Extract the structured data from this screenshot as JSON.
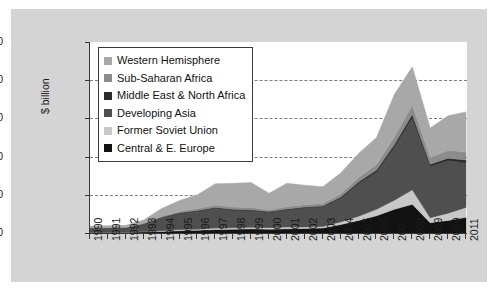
{
  "figure": {
    "background": "#d4d4d4",
    "plot_background": "#ffffff",
    "axis_color": "#3a3a3a",
    "grid_color": "#7d7d7d"
  },
  "chart_data": {
    "type": "area",
    "stacked": true,
    "title": "",
    "xlabel": "",
    "ylabel": "$ billion",
    "ylim": [
      0,
      500
    ],
    "yticks": [
      0,
      100,
      200,
      300,
      400,
      500
    ],
    "grid": true,
    "grid_style": "dashed",
    "legend_position": "upper-left",
    "categories": [
      "1990",
      "1991",
      "1992",
      "1993",
      "1994",
      "1995",
      "1996",
      "1997",
      "1998",
      "1999",
      "2000",
      "2001",
      "2002",
      "2003",
      "2004",
      "2005",
      "2006",
      "2007",
      "2008",
      "2009",
      "2010",
      "2011"
    ],
    "series": [
      {
        "name": "Central & E. Europe",
        "color": "#121212",
        "values": [
          2,
          2,
          2,
          3,
          4,
          6,
          7,
          9,
          10,
          11,
          10,
          11,
          12,
          13,
          22,
          33,
          45,
          62,
          75,
          27,
          33,
          41
        ]
      },
      {
        "name": "Former Soviet Union",
        "color": "#c8c8c8",
        "values": [
          0,
          0,
          0,
          1,
          2,
          3,
          3,
          4,
          4,
          4,
          4,
          5,
          4,
          4,
          7,
          11,
          17,
          24,
          38,
          13,
          19,
          26
        ]
      },
      {
        "name": "Developing Asia",
        "color": "#4f4f4f",
        "values": [
          10,
          10,
          11,
          19,
          34,
          42,
          47,
          52,
          46,
          44,
          40,
          45,
          50,
          52,
          62,
          86,
          98,
          140,
          190,
          135,
          138,
          117
        ]
      },
      {
        "name": "Middle East & North Africa",
        "color": "#2b2b2b",
        "values": [
          1,
          1,
          1,
          1,
          1,
          2,
          2,
          2,
          2,
          2,
          2,
          2,
          2,
          2,
          3,
          4,
          5,
          6,
          8,
          5,
          6,
          7
        ]
      },
      {
        "name": "Sub-Saharan Africa",
        "color": "#8c8c8c",
        "values": [
          1,
          1,
          1,
          2,
          3,
          4,
          5,
          6,
          6,
          6,
          5,
          6,
          6,
          6,
          8,
          11,
          14,
          19,
          24,
          18,
          20,
          22
        ]
      },
      {
        "name": "Western Hemisphere",
        "color": "#a8a8a8",
        "values": [
          4,
          5,
          5,
          8,
          20,
          28,
          36,
          56,
          62,
          65,
          43,
          61,
          51,
          44,
          55,
          63,
          71,
          112,
          100,
          77,
          91,
          104
        ]
      }
    ],
    "totals": [
      18,
      19,
      20,
      34,
      64,
      85,
      100,
      129,
      130,
      132,
      104,
      130,
      125,
      121,
      157,
      208,
      250,
      363,
      435,
      275,
      307,
      317
    ]
  },
  "legend": {
    "items": [
      {
        "label": "Western Hemisphere",
        "color": "#a8a8a8"
      },
      {
        "label": "Sub-Saharan Africa",
        "color": "#8c8c8c"
      },
      {
        "label": "Middle East & North Africa",
        "color": "#2b2b2b"
      },
      {
        "label": "Developing Asia",
        "color": "#4f4f4f"
      },
      {
        "label": "Former Soviet Union",
        "color": "#c8c8c8"
      },
      {
        "label": "Central & E. Europe",
        "color": "#121212"
      }
    ]
  }
}
